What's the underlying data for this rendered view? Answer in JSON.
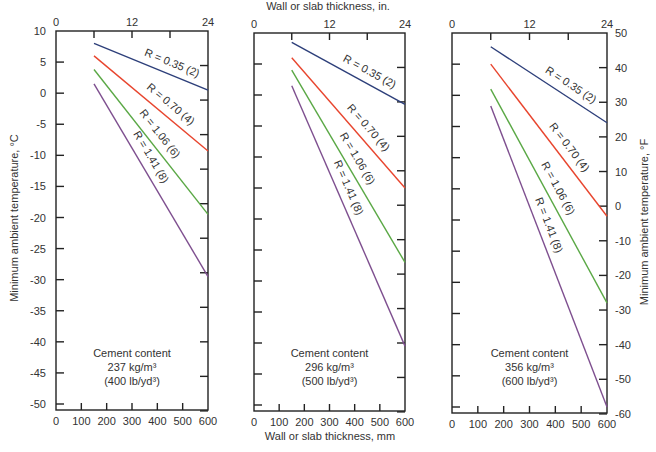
{
  "chart_data": {
    "type": "line",
    "title": "",
    "top_xlabel": "Wall or slab thickness, in.",
    "xlabel": "Wall or slab thickness, mm",
    "ylabel_left": "Minimum ambient temperature, °C",
    "ylabel_right": "Minimum ambient temperature, °F",
    "x_ticks_mm": [
      0,
      100,
      200,
      300,
      400,
      500,
      600
    ],
    "x_ticks_in": [
      0,
      12,
      24
    ],
    "y_ticks_c": [
      10,
      5,
      0,
      -5,
      -10,
      -15,
      -20,
      -25,
      -30,
      -35,
      -40,
      -45,
      -50
    ],
    "y_ticks_f": [
      50,
      40,
      30,
      20,
      10,
      0,
      -10,
      -20,
      -30,
      -40,
      -50,
      -60
    ],
    "xlim": [
      0,
      600
    ],
    "ylim_c": [
      -50,
      10
    ],
    "grid": false,
    "series_colors": [
      "#2d3f7a",
      "#e8452e",
      "#5aa845",
      "#7e4f8f"
    ],
    "series_labels": [
      "R = 0.35 (2)",
      "R = 0.70 (4)",
      "R = 1.06 (6)",
      "R = 1.41 (8)"
    ],
    "panels": [
      {
        "note_line1": "Cement content",
        "note_line2": "237 kg/m³",
        "note_line3": "(400 lb/yd³)",
        "x": [
          150,
          600
        ],
        "series": [
          {
            "name": "R = 0.35 (2)",
            "values_c": [
              8.0,
              0.5
            ]
          },
          {
            "name": "R = 0.70 (4)",
            "values_c": [
              6.0,
              -9.3
            ]
          },
          {
            "name": "R = 1.06 (6)",
            "values_c": [
              3.8,
              -19.5
            ]
          },
          {
            "name": "R = 1.41 (8)",
            "values_c": [
              1.5,
              -29.5
            ]
          }
        ]
      },
      {
        "note_line1": "Cement content",
        "note_line2": "296 kg/m³",
        "note_line3": "(500 lb/yd³)",
        "x": [
          150,
          600
        ],
        "series": [
          {
            "name": "R = 0.35 (2)",
            "values_c": [
              8.5,
              -1.5
            ]
          },
          {
            "name": "R = 0.70 (4)",
            "values_c": [
              6.0,
              -15.0
            ]
          },
          {
            "name": "R = 1.06 (6)",
            "values_c": [
              4.0,
              -27.0
            ]
          },
          {
            "name": "R = 1.41 (8)",
            "values_c": [
              1.5,
              -40.5
            ]
          }
        ]
      },
      {
        "note_line1": "Cement content",
        "note_line2": "356 kg/m³",
        "note_line3": "(600 lb/yd³)",
        "x": [
          150,
          600
        ],
        "series": [
          {
            "name": "R = 0.35 (2)",
            "values_c": [
              7.8,
              -4.4
            ]
          },
          {
            "name": "R = 0.70 (4)",
            "values_c": [
              5.0,
              -19.4
            ]
          },
          {
            "name": "R = 1.06 (6)",
            "values_c": [
              1.0,
              -33.3
            ]
          },
          {
            "name": "R = 1.41 (8)",
            "values_c": [
              -1.7,
              -50.0
            ]
          }
        ]
      }
    ]
  }
}
